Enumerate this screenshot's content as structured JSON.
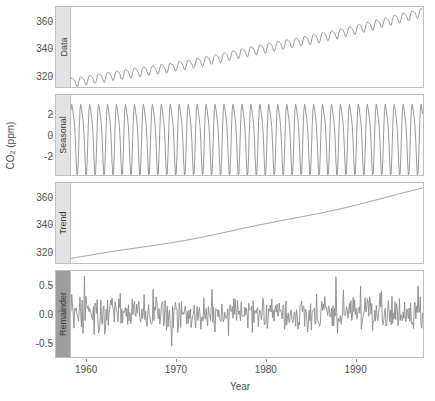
{
  "chart_data": {
    "type": "line",
    "title": "",
    "xlabel": "Year",
    "ylabel": "CO2 (ppm)",
    "ylabel_base": "CO",
    "ylabel_sub": "2",
    "ylabel_unit": " (ppm)",
    "decomposition": "STL",
    "grid": false,
    "legend": "none",
    "line_color": "#8c8c8c",
    "panel_border_color": "#bfbfbf",
    "strip_color_light": "#e3e3e3",
    "strip_color_dark": "#9e9e9e",
    "x": {
      "range": [
        1958.2,
        1997.5
      ],
      "ticks": [
        1960,
        1970,
        1980,
        1990
      ],
      "tick_labels": [
        "1960",
        "1970",
        "1980",
        "1990"
      ]
    },
    "panels": [
      {
        "name": "Data",
        "strip_label": "Data",
        "strip_shade": "light",
        "ylim": [
          312,
          370
        ],
        "yticks": [
          320,
          340,
          360
        ],
        "ytick_labels": [
          "320",
          "340",
          "360"
        ],
        "description": "Observed monthly atmospheric CO2 with rising trend and annual oscillation",
        "series_start": 315.5,
        "series_end": 366.5,
        "seasonal_amplitude": 3.2
      },
      {
        "name": "Seasonal",
        "strip_label": "Seasonal",
        "strip_shade": "light",
        "ylim": [
          -3.8,
          3.8
        ],
        "yticks": [
          -2,
          0,
          2
        ],
        "ytick_labels": [
          "-2",
          "0",
          "2"
        ],
        "description": "Annual seasonal cycle oscillating between about -3.2 and +3.2 ppm",
        "amplitude": 3.2,
        "period_years": 1
      },
      {
        "name": "Trend",
        "strip_label": "Trend",
        "strip_shade": "light",
        "ylim": [
          312,
          370
        ],
        "yticks": [
          320,
          340,
          360
        ],
        "ytick_labels": [
          "320",
          "340",
          "360"
        ],
        "description": "Smooth monotonically increasing trend component",
        "series_start": 315.3,
        "series_end": 366.0
      },
      {
        "name": "Remainder",
        "strip_label": "Remainder",
        "strip_shade": "dark",
        "ylim": [
          -0.75,
          0.75
        ],
        "yticks": [
          -0.5,
          0.0,
          0.5
        ],
        "ytick_labels": [
          "-0.5",
          "0.0",
          "0.5"
        ],
        "description": "High frequency residual noise centered on zero, mostly within plus or minus 0.3 ppm",
        "noise_sd": 0.18,
        "max_spike": 0.62
      }
    ]
  }
}
